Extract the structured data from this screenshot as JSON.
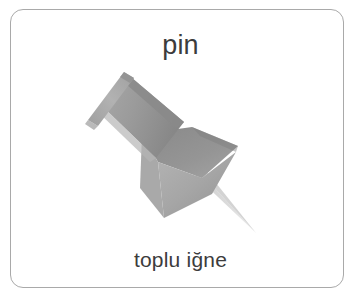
{
  "card": {
    "headword": "pin",
    "translation": "toplu iğne",
    "border_color": "#a9a9a9",
    "background_color": "#ffffff",
    "text_color": "#3c3c3c"
  },
  "illustration": {
    "name": "pushpin-illustration",
    "subject": "pushpin",
    "style": "grayscale photo cut-out",
    "colors": {
      "cap_light": "#b4b4b4",
      "cap_mid": "#9a9a9a",
      "shaft_dark": "#8b8b8b",
      "shaft_light": "#a6a6a6",
      "cone_dark": "#8f8f8f",
      "cone_light": "#b0b0b0",
      "cone_mid": "#9d9d9d",
      "needle": "#d3d3d3",
      "needle_edge": "#bdbdbd",
      "outline": "#7f7f7f"
    }
  }
}
